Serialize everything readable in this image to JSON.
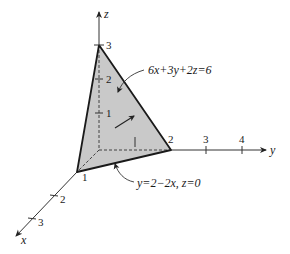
{
  "figure": {
    "type": "3d-coordinate-diagram"
  },
  "axes": {
    "x": {
      "label": "x",
      "ticks": [
        "1",
        "2",
        "3"
      ]
    },
    "y": {
      "label": "y",
      "ticks": [
        "2",
        "3",
        "4"
      ]
    },
    "z": {
      "label": "z",
      "ticks": [
        "1",
        "2",
        "3"
      ]
    }
  },
  "annotations": {
    "plane_equation": "6x+3y+2z=6",
    "trace_equation": "y=2−2x, z=0"
  },
  "vertices": {
    "x_intercept": "1",
    "y_intercept": "2",
    "z_intercept": "3"
  },
  "colors": {
    "face_fill": "#c8c8c8",
    "edge": "#1a1a1a",
    "axis": "#333333"
  }
}
